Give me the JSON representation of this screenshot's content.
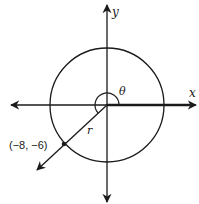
{
  "diagram": {
    "type": "unit-circle-angle",
    "axes": {
      "x_label": "x",
      "y_label": "y"
    },
    "angle": {
      "label": "θ",
      "description": "angle measured counterclockwise from positive x-axis to terminal ray"
    },
    "radius": {
      "label": "r"
    },
    "point": {
      "label": "(−8, −6)",
      "x": -8,
      "y": -6
    },
    "colors": {
      "stroke": "#1a1a1a",
      "background": "#ffffff"
    }
  }
}
